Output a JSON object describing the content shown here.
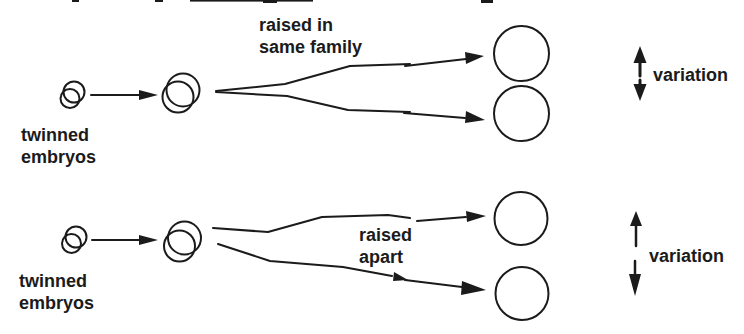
{
  "page": {
    "background": "#ffffff",
    "ink": "#1b1b1b"
  },
  "top_panel": {
    "source_label_line1": "twinned",
    "source_label_line2": "embryos",
    "condition_label_line1": "raised in",
    "condition_label_line2": "same family",
    "variation_label": "variation"
  },
  "bottom_panel": {
    "source_label_line1": "twinned",
    "source_label_line2": "embryos",
    "condition_label_line1": "raised",
    "condition_label_line2": "apart",
    "variation_label": "variation"
  }
}
